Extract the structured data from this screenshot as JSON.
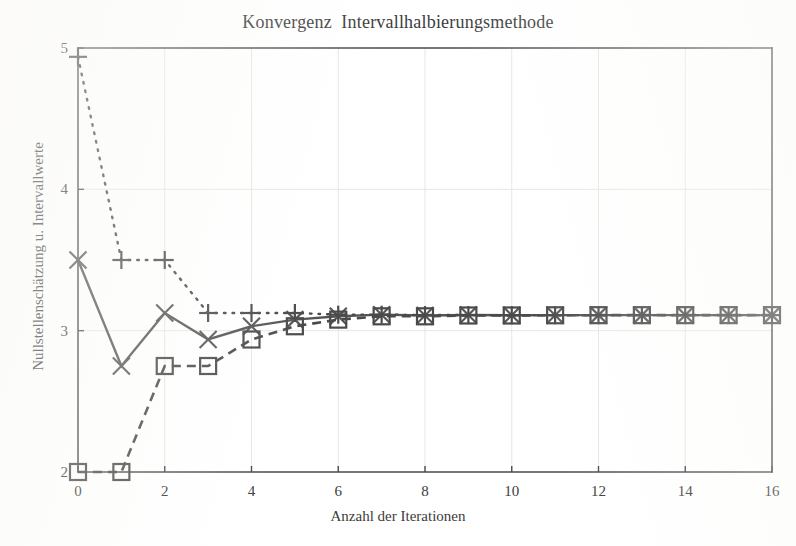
{
  "chart_data": {
    "type": "line",
    "title": "Konvergenz  Intervallhalbierungsmethode",
    "xlabel": "Anzahl der Iterationen",
    "ylabel": "Nullstellenschätzung u. Intervallwerte",
    "xlim": [
      0,
      16
    ],
    "ylim": [
      2,
      5
    ],
    "xticks": [
      0,
      2,
      4,
      6,
      8,
      10,
      12,
      14,
      16
    ],
    "xtick_labels": [
      "0",
      "2",
      "4",
      "6",
      "8",
      "10",
      "12",
      "14",
      "16"
    ],
    "yticks": [
      2,
      3,
      4,
      5
    ],
    "ytick_labels": [
      "2",
      "3",
      "4",
      "5"
    ],
    "grid": true,
    "legend": "none",
    "x": [
      0,
      1,
      2,
      3,
      4,
      5,
      6,
      7,
      8,
      9,
      10,
      11,
      12,
      13,
      14,
      15,
      16
    ],
    "series": [
      {
        "name": "Nullstellenschätzung",
        "marker": "x",
        "linestyle": "solid",
        "color": "#555555",
        "values": [
          3.5,
          2.75,
          3.125,
          2.9375,
          3.03125,
          3.078125,
          3.1015625,
          3.11328125,
          3.107421875,
          3.1103515625,
          3.10888671875,
          3.109619140625,
          3.1099853515625,
          3.10980224609375,
          3.109893798828125,
          3.1099395751953125,
          3.1099166870117188
        ]
      },
      {
        "name": "oberer Intervallwert",
        "marker": "plus",
        "linestyle": "dotted",
        "color": "#4a4a4a",
        "values": [
          4.9375,
          3.5,
          3.5,
          3.125,
          3.125,
          3.125,
          3.11328125,
          3.11328125,
          3.110351562,
          3.110351562,
          3.109619141,
          3.109619141,
          3.109619141,
          3.109619141,
          3.109939575,
          3.109939575,
          3.109939575
        ]
      },
      {
        "name": "unterer Intervallwert",
        "marker": "square",
        "linestyle": "dashed",
        "color": "#4a4a4a",
        "values": [
          2.0,
          2.0,
          2.75,
          2.75,
          2.9375,
          3.03125,
          3.078125,
          3.1015625,
          3.1015625,
          3.107421875,
          3.107421875,
          3.108886719,
          3.109619141,
          3.109619141,
          3.109802246,
          3.109893799,
          3.109893799
        ]
      }
    ]
  },
  "figure": {
    "background_color": "#ffffff",
    "axis_color": "#4a4a4a",
    "grid_color": "#e8e6e0",
    "text_color": "#3c3c3c"
  }
}
